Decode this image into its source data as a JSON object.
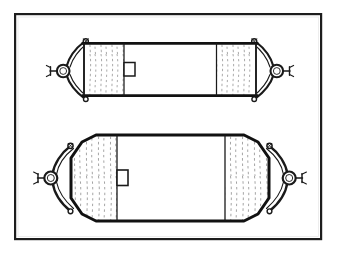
{
  "document": {
    "type": "technical-line-drawing",
    "title": "Inflatable lift bag / salvage pontoon — deflated and inflated views",
    "background_color": "#ffffff",
    "ink_color": "#1a1a1a",
    "frame_color": "#1d1d1d",
    "fill_color": "#ffffff",
    "hatch_color": "#8a8a8a"
  },
  "frame": {
    "label": "drawing-border",
    "x": 14,
    "y": 13,
    "width": 308,
    "height": 227,
    "stroke_width": 2.2
  },
  "figures": [
    {
      "id": "figure-top",
      "label": "Deflated cylindrical bag — side elevation",
      "state": "deflated",
      "body": {
        "shape": "rectangle",
        "x": 83,
        "y": 43,
        "width": 174,
        "height": 53,
        "edge_stroke_width": 2.6,
        "side_stroke_width": 1.6
      },
      "seams": [
        {
          "name": "left-seam",
          "x": 124
        },
        {
          "name": "right-seam",
          "x": 216
        }
      ],
      "gather_panels": [
        {
          "name": "left-gather-panel",
          "x": 86,
          "width": 38
        },
        {
          "name": "right-gather-panel",
          "x": 216,
          "width": 38
        }
      ],
      "valve": {
        "name": "inflation-valve",
        "x": 124,
        "y": 62,
        "width": 11,
        "height": 14
      },
      "end_fittings": [
        {
          "name": "left-end-fitting",
          "side": "left",
          "ring_cx": 63,
          "ring_cy": 71,
          "ring_r": 6.2,
          "pin_x": 50,
          "eyelet_top": {
            "cx": 86,
            "cy": 41
          },
          "eyelet_bottom": {
            "cx": 86,
            "cy": 99
          }
        },
        {
          "name": "right-end-fitting",
          "side": "right",
          "ring_cx": 274,
          "ring_cy": 71,
          "ring_r": 6.2,
          "pin_x": 287,
          "eyelet_top": {
            "cx": 254,
            "cy": 41
          },
          "eyelet_bottom": {
            "cx": 254,
            "cy": 99
          }
        }
      ]
    },
    {
      "id": "figure-bottom",
      "label": "Inflated cylindrical bag with tapered ends — side elevation",
      "state": "inflated",
      "body": {
        "shape": "rounded-tapered-cylinder",
        "x": 70,
        "y": 135,
        "width": 200,
        "height": 86,
        "edge_stroke_width": 3.0,
        "taper": 26
      },
      "seams": [
        {
          "name": "left-seam",
          "x": 117
        },
        {
          "name": "right-seam",
          "x": 225
        }
      ],
      "gather_panels": [
        {
          "name": "left-gather-panel",
          "x": 74,
          "width": 43
        },
        {
          "name": "right-gather-panel",
          "x": 225,
          "width": 43
        }
      ],
      "valve": {
        "name": "inflation-valve",
        "x": 117,
        "y": 170,
        "width": 11,
        "height": 16
      },
      "end_fittings": [
        {
          "name": "left-end-fitting",
          "side": "left",
          "ring_cx": 51,
          "ring_cy": 178,
          "ring_r": 6.4,
          "pin_x": 38,
          "eyelet_top": {
            "cx": 70,
            "cy": 146
          },
          "eyelet_bottom": {
            "cx": 70,
            "cy": 211
          }
        },
        {
          "name": "right-end-fitting",
          "side": "right",
          "ring_cx": 289,
          "ring_cy": 178,
          "ring_r": 6.4,
          "pin_x": 302,
          "eyelet_top": {
            "cx": 270,
            "cy": 146
          },
          "eyelet_bottom": {
            "cx": 270,
            "cy": 211
          }
        }
      ]
    }
  ],
  "captions": {
    "visible_text": ""
  }
}
